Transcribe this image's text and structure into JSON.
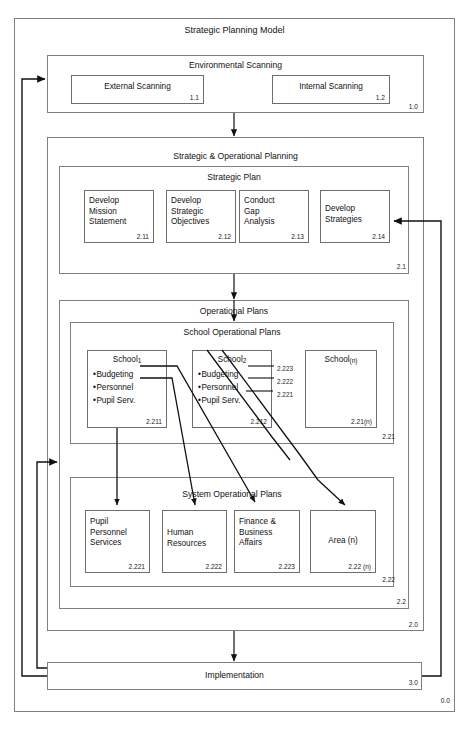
{
  "diagram": {
    "title": "Strategic Planning Model",
    "outer_code": "0.0"
  },
  "environmental_scanning": {
    "title": "Environmental Scanning",
    "code": "1.0",
    "boxes": [
      {
        "label": "External Scanning",
        "code": "1.1"
      },
      {
        "label": "Internal Scanning",
        "code": "1.2"
      }
    ]
  },
  "strategic_operational_planning": {
    "title": "Strategic & Operational Planning",
    "code": "2.0"
  },
  "strategic_plan": {
    "title": "Strategic Plan",
    "code": "2.1",
    "boxes": [
      {
        "label": "Develop\nMission\nStatement",
        "code": "2.11"
      },
      {
        "label": "Develop\nStrategic\nObjectives",
        "code": "2.12"
      },
      {
        "label": "Conduct\nGap\nAnalysis",
        "code": "2.13"
      },
      {
        "label": "Develop\nStrategies",
        "code": "2.14"
      }
    ]
  },
  "operational_plans": {
    "title": "Operational Plans",
    "code": "2.2"
  },
  "school_operational_plans": {
    "title": "School Operational Plans",
    "code": "2.21",
    "schools": [
      {
        "name": "School",
        "index": "1",
        "code": "2.211",
        "items": [
          "Budgeting",
          "Personnel",
          "Pupil Serv."
        ],
        "item_codes": [
          "",
          "",
          ""
        ]
      },
      {
        "name": "School",
        "index": "2",
        "code": "2.212",
        "items": [
          "Budgeting",
          "Personnel",
          "Pupil Serv."
        ],
        "item_codes": [
          "2.223",
          "2.222",
          "2.221"
        ]
      },
      {
        "name": "School",
        "index": "(n)",
        "code": "2.21(n)",
        "items": [],
        "item_codes": []
      }
    ]
  },
  "system_operational_plans": {
    "title": "System Operational Plans",
    "code": "2.22",
    "boxes": [
      {
        "label": "Pupil\nPersonnel\nServices",
        "code": "2.221"
      },
      {
        "label": "Human\nResources",
        "code": "2.222"
      },
      {
        "label": "Finance &\nBusiness\nAffairs",
        "code": "2.223"
      },
      {
        "label": "Area (n)",
        "code": "2.22 (n)"
      }
    ]
  },
  "implementation": {
    "title": "Implementation",
    "code": "3.0"
  },
  "colors": {
    "line": "#808080",
    "leaf_border": "#6e6e6e",
    "arrow": "#111111",
    "text": "#111111"
  }
}
